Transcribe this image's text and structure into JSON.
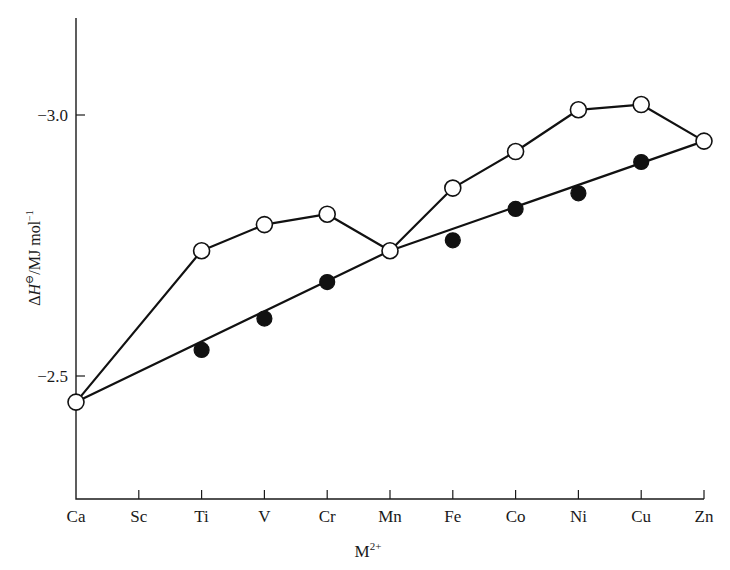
{
  "chart_data": {
    "type": "line",
    "title": "",
    "xlabel": "M2+",
    "xlabel_main": "M",
    "xlabel_sup": "2+",
    "ylabel": "ΔH⊖/MJ mol⁻¹",
    "ylabel_parts": {
      "delta": "Δ",
      "H": "H",
      "sup": "⊖",
      "unit": "/MJ mol",
      "unit_sup": "−1"
    },
    "categories": [
      "Ca",
      "Sc",
      "Ti",
      "V",
      "Cr",
      "Mn",
      "Fe",
      "Co",
      "Ni",
      "Cu",
      "Zn"
    ],
    "yticks": [
      {
        "value": -3.0,
        "label": "−3.0"
      },
      {
        "value": -2.5,
        "label": "−2.5"
      }
    ],
    "ylim": [
      -2.34,
      -3.16
    ],
    "y_inverted": true,
    "grid": false,
    "legend": "none",
    "series": [
      {
        "name": "observed (open circles)",
        "marker": "open",
        "values": [
          -2.45,
          null,
          -2.74,
          -2.79,
          -2.81,
          -2.74,
          -2.86,
          -2.93,
          -3.01,
          -3.02,
          -2.95
        ]
      },
      {
        "name": "corrected / reference (filled circles)",
        "marker": "filled",
        "values": [
          null,
          null,
          -2.55,
          -2.61,
          -2.68,
          null,
          -2.76,
          -2.82,
          -2.85,
          -2.91,
          null
        ]
      },
      {
        "name": "reference line (Ca–Mn–Zn)",
        "marker": "none",
        "values": [
          -2.45,
          null,
          null,
          null,
          null,
          -2.74,
          null,
          null,
          null,
          null,
          -2.95
        ]
      }
    ]
  }
}
